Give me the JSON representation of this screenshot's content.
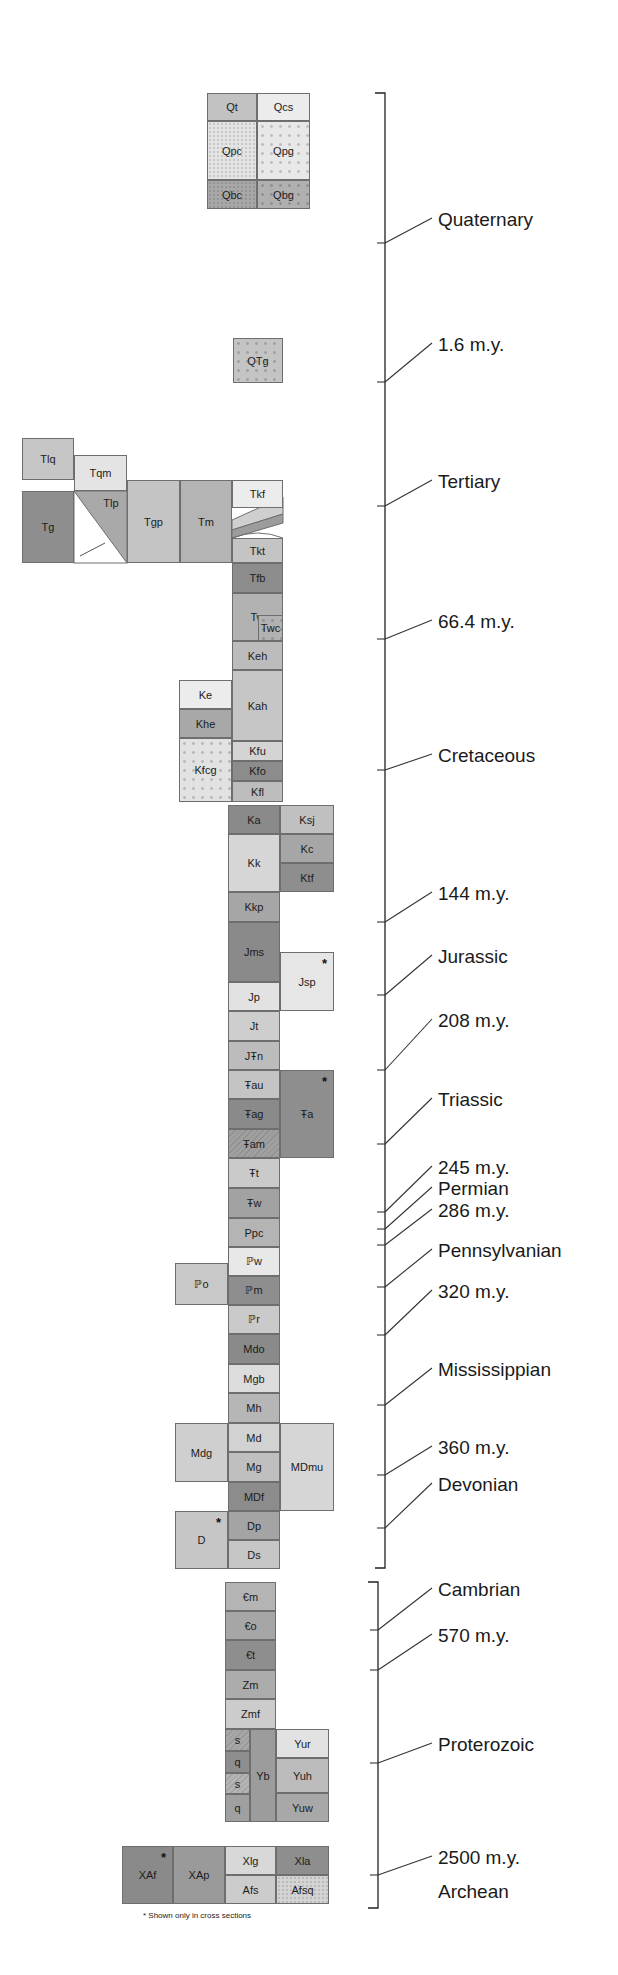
{
  "chart_data": {
    "type": "diagram",
    "units": [
      {
        "id": "Qt",
        "x": 207,
        "y": 93,
        "w": 50,
        "h": 28,
        "color": "#c2c2c2",
        "pattern": "none"
      },
      {
        "id": "Qcs",
        "x": 257,
        "y": 93,
        "w": 53,
        "h": 28,
        "color": "#ececec",
        "pattern": "none"
      },
      {
        "id": "Qpc",
        "x": 207,
        "y": 121,
        "w": 50,
        "h": 59,
        "color": "#e4e4e4",
        "pattern": "stipple"
      },
      {
        "id": "Qpg",
        "x": 257,
        "y": 121,
        "w": 53,
        "h": 59,
        "color": "#e8e8e8",
        "pattern": "dots"
      },
      {
        "id": "Qbc",
        "x": 207,
        "y": 180,
        "w": 50,
        "h": 29,
        "color": "#a8a8a8",
        "pattern": "stipple"
      },
      {
        "id": "Qbg",
        "x": 257,
        "y": 180,
        "w": 53,
        "h": 29,
        "color": "#b0b0b0",
        "pattern": "dots"
      },
      {
        "id": "QTg",
        "x": 233,
        "y": 338,
        "w": 50,
        "h": 45,
        "color": "#c4c4c4",
        "pattern": "dots"
      },
      {
        "id": "Tlq",
        "x": 22,
        "y": 438,
        "w": 52,
        "h": 42,
        "color": "#c6c6c6",
        "pattern": "none"
      },
      {
        "id": "Tqm",
        "x": 74,
        "y": 455,
        "w": 53,
        "h": 36,
        "color": "#e4e4e4",
        "pattern": "none"
      },
      {
        "id": "Tg",
        "x": 22,
        "y": 491,
        "w": 52,
        "h": 72,
        "color": "#8e8e8e",
        "pattern": "none"
      },
      {
        "id": "Tgp",
        "x": 127,
        "y": 480,
        "w": 53,
        "h": 83,
        "color": "#c4c4c4",
        "pattern": "none"
      },
      {
        "id": "Tm",
        "x": 180,
        "y": 480,
        "w": 52,
        "h": 83,
        "color": "#b4b4b4",
        "pattern": "none"
      },
      {
        "id": "Tkf",
        "x": 232,
        "y": 480,
        "w": 51,
        "h": 28,
        "color": "#ececec",
        "pattern": "none"
      },
      {
        "id": "Tkt",
        "x": 232,
        "y": 538,
        "w": 51,
        "h": 25,
        "color": "#c4c4c4",
        "pattern": "none"
      },
      {
        "id": "Tfb",
        "x": 232,
        "y": 563,
        "w": 51,
        "h": 30,
        "color": "#8c8c8c",
        "pattern": "none"
      },
      {
        "id": "Tw",
        "x": 232,
        "y": 593,
        "w": 51,
        "h": 48,
        "color": "#b2b2b2",
        "pattern": "none"
      },
      {
        "id": "Twc",
        "x": 258,
        "y": 615,
        "w": 25,
        "h": 26,
        "color": "#b2b2b2",
        "pattern": "dots"
      },
      {
        "id": "Keh",
        "x": 232,
        "y": 641,
        "w": 51,
        "h": 29,
        "color": "#bcbcbc",
        "pattern": "none"
      },
      {
        "id": "Kah",
        "x": 232,
        "y": 670,
        "w": 51,
        "h": 71,
        "color": "#c6c6c6",
        "pattern": "none"
      },
      {
        "id": "Ke",
        "x": 179,
        "y": 680,
        "w": 53,
        "h": 29,
        "color": "#ececec",
        "pattern": "none"
      },
      {
        "id": "Khe",
        "x": 179,
        "y": 709,
        "w": 53,
        "h": 29,
        "color": "#a8a8a8",
        "pattern": "none"
      },
      {
        "id": "Kfcg",
        "x": 179,
        "y": 738,
        "w": 53,
        "h": 64,
        "color": "#e2e2e2",
        "pattern": "dots"
      },
      {
        "id": "Kfu",
        "x": 232,
        "y": 741,
        "w": 51,
        "h": 20,
        "color": "#d4d4d4",
        "pattern": "none"
      },
      {
        "id": "Kfo",
        "x": 232,
        "y": 761,
        "w": 51,
        "h": 20,
        "color": "#8c8c8c",
        "pattern": "none"
      },
      {
        "id": "Kfl",
        "x": 232,
        "y": 781,
        "w": 51,
        "h": 21,
        "color": "#bdbdbd",
        "pattern": "none"
      },
      {
        "id": "Ka",
        "x": 228,
        "y": 805,
        "w": 52,
        "h": 29,
        "color": "#8a8a8a",
        "pattern": "none"
      },
      {
        "id": "Ksj",
        "x": 280,
        "y": 805,
        "w": 54,
        "h": 29,
        "color": "#c0c0c0",
        "pattern": "none"
      },
      {
        "id": "Kk",
        "x": 228,
        "y": 834,
        "w": 52,
        "h": 58,
        "color": "#d6d6d6",
        "pattern": "none"
      },
      {
        "id": "Kc",
        "x": 280,
        "y": 834,
        "w": 54,
        "h": 29,
        "color": "#a6a6a6",
        "pattern": "none"
      },
      {
        "id": "Ktf",
        "x": 280,
        "y": 863,
        "w": 54,
        "h": 29,
        "color": "#8e8e8e",
        "pattern": "none"
      },
      {
        "id": "Kkp",
        "x": 228,
        "y": 892,
        "w": 52,
        "h": 30,
        "color": "#a6a6a6",
        "pattern": "none"
      },
      {
        "id": "Jms",
        "x": 228,
        "y": 922,
        "w": 52,
        "h": 60,
        "color": "#8a8a8a",
        "pattern": "none"
      },
      {
        "id": "Jsp",
        "x": 280,
        "y": 952,
        "w": 54,
        "h": 59,
        "color": "#e6e6e6",
        "pattern": "none",
        "star": true
      },
      {
        "id": "Jp",
        "x": 228,
        "y": 982,
        "w": 52,
        "h": 29,
        "color": "#e2e2e2",
        "pattern": "none"
      },
      {
        "id": "Jt",
        "x": 228,
        "y": 1011,
        "w": 52,
        "h": 30,
        "color": "#cecece",
        "pattern": "none"
      },
      {
        "id": "JTRn",
        "label": "JŦn",
        "x": 228,
        "y": 1041,
        "w": 52,
        "h": 29,
        "color": "#bcbcbc",
        "pattern": "none"
      },
      {
        "id": "TRau",
        "label": "Ŧau",
        "x": 228,
        "y": 1070,
        "w": 52,
        "h": 29,
        "color": "#c4c4c4",
        "pattern": "none"
      },
      {
        "id": "TRa",
        "label": "Ŧa",
        "x": 280,
        "y": 1070,
        "w": 54,
        "h": 88,
        "color": "#8e8e8e",
        "pattern": "none",
        "star": true
      },
      {
        "id": "TRag",
        "label": "Ŧag",
        "x": 228,
        "y": 1099,
        "w": 52,
        "h": 30,
        "color": "#8a8a8a",
        "pattern": "none"
      },
      {
        "id": "TRam",
        "label": "Ŧam",
        "x": 228,
        "y": 1129,
        "w": 52,
        "h": 29,
        "color": "#a0a0a0",
        "pattern": "hatch"
      },
      {
        "id": "TRt",
        "label": "Ŧt",
        "x": 228,
        "y": 1158,
        "w": 52,
        "h": 30,
        "color": "#cacaca",
        "pattern": "none"
      },
      {
        "id": "TRw",
        "label": "Ŧw",
        "x": 228,
        "y": 1188,
        "w": 52,
        "h": 30,
        "color": "#a2a2a2",
        "pattern": "none"
      },
      {
        "id": "Ppc",
        "x": 228,
        "y": 1218,
        "w": 52,
        "h": 29,
        "color": "#b4b4b4",
        "pattern": "none"
      },
      {
        "id": "IPw",
        "label": "ℙw",
        "x": 228,
        "y": 1247,
        "w": 52,
        "h": 29,
        "color": "#e8e8e8",
        "pattern": "none"
      },
      {
        "id": "IPo",
        "label": "ℙo",
        "x": 175,
        "y": 1263,
        "w": 53,
        "h": 42,
        "color": "#c8c8c8",
        "pattern": "none"
      },
      {
        "id": "IPm",
        "label": "ℙm",
        "x": 228,
        "y": 1276,
        "w": 52,
        "h": 29,
        "color": "#8e8e8e",
        "pattern": "none"
      },
      {
        "id": "IPr",
        "label": "ℙr",
        "x": 228,
        "y": 1305,
        "w": 52,
        "h": 29,
        "color": "#cacaca",
        "pattern": "none"
      },
      {
        "id": "Mdo",
        "x": 228,
        "y": 1334,
        "w": 52,
        "h": 30,
        "color": "#8a8a8a",
        "pattern": "none"
      },
      {
        "id": "Mgb",
        "x": 228,
        "y": 1364,
        "w": 52,
        "h": 29,
        "color": "#dcdcdc",
        "pattern": "none"
      },
      {
        "id": "Mh",
        "x": 228,
        "y": 1393,
        "w": 52,
        "h": 30,
        "color": "#b6b6b6",
        "pattern": "none"
      },
      {
        "id": "Mdg",
        "x": 175,
        "y": 1423,
        "w": 53,
        "h": 59,
        "color": "#cfcfcf",
        "pattern": "none"
      },
      {
        "id": "Md",
        "x": 228,
        "y": 1423,
        "w": 52,
        "h": 29,
        "color": "#d2d2d2",
        "pattern": "none"
      },
      {
        "id": "MDmu",
        "x": 280,
        "y": 1423,
        "w": 54,
        "h": 88,
        "color": "#d6d6d6",
        "pattern": "none"
      },
      {
        "id": "Mg",
        "x": 228,
        "y": 1452,
        "w": 52,
        "h": 30,
        "color": "#bfbfbf",
        "pattern": "none"
      },
      {
        "id": "MDf",
        "x": 228,
        "y": 1482,
        "w": 52,
        "h": 29,
        "color": "#8c8c8c",
        "pattern": "none"
      },
      {
        "id": "D",
        "x": 175,
        "y": 1511,
        "w": 53,
        "h": 58,
        "color": "#c6c6c6",
        "pattern": "none",
        "star": true
      },
      {
        "id": "Dp",
        "x": 228,
        "y": 1511,
        "w": 52,
        "h": 29,
        "color": "#a4a4a4",
        "pattern": "none"
      },
      {
        "id": "Ds",
        "x": 228,
        "y": 1540,
        "w": 52,
        "h": 29,
        "color": "#c6c6c6",
        "pattern": "none"
      },
      {
        "id": "Cm",
        "label": "€m",
        "x": 225,
        "y": 1582,
        "w": 51,
        "h": 29,
        "color": "#b4b4b4",
        "pattern": "none"
      },
      {
        "id": "Co",
        "label": "€o",
        "x": 225,
        "y": 1611,
        "w": 51,
        "h": 29,
        "color": "#a6a6a6",
        "pattern": "none"
      },
      {
        "id": "Ct",
        "label": "€t",
        "x": 225,
        "y": 1640,
        "w": 51,
        "h": 30,
        "color": "#8e8e8e",
        "pattern": "none"
      },
      {
        "id": "Zm",
        "x": 225,
        "y": 1670,
        "w": 51,
        "h": 29,
        "color": "#acacac",
        "pattern": "none"
      },
      {
        "id": "Zmf",
        "x": 225,
        "y": 1699,
        "w": 51,
        "h": 30,
        "color": "#cccccc",
        "pattern": "none"
      },
      {
        "id": "s1",
        "label": "s",
        "x": 225,
        "y": 1729,
        "w": 25,
        "h": 22,
        "color": "#a8a8a8",
        "pattern": "hatch"
      },
      {
        "id": "q1",
        "label": "q",
        "x": 225,
        "y": 1751,
        "w": 25,
        "h": 22,
        "color": "#8e8e8e",
        "pattern": "none"
      },
      {
        "id": "s2",
        "label": "s",
        "x": 225,
        "y": 1773,
        "w": 25,
        "h": 21,
        "color": "#b4b4b4",
        "pattern": "hatch"
      },
      {
        "id": "q2",
        "label": "q",
        "x": 225,
        "y": 1794,
        "w": 25,
        "h": 28,
        "color": "#a0a0a0",
        "pattern": "none"
      },
      {
        "id": "Yb",
        "x": 250,
        "y": 1729,
        "w": 26,
        "h": 93,
        "color": "#9c9c9c",
        "pattern": "none"
      },
      {
        "id": "Yur",
        "x": 276,
        "y": 1729,
        "w": 53,
        "h": 29,
        "color": "#e2e2e2",
        "pattern": "none"
      },
      {
        "id": "Yuh",
        "x": 276,
        "y": 1758,
        "w": 53,
        "h": 35,
        "color": "#bcbcbc",
        "pattern": "none"
      },
      {
        "id": "Yuw",
        "x": 276,
        "y": 1793,
        "w": 53,
        "h": 29,
        "color": "#a8a8a8",
        "pattern": "none"
      },
      {
        "id": "XAf",
        "x": 122,
        "y": 1846,
        "w": 51,
        "h": 58,
        "color": "#8a8a8a",
        "pattern": "none",
        "star": true
      },
      {
        "id": "XAp",
        "x": 173,
        "y": 1846,
        "w": 52,
        "h": 58,
        "color": "#9a9a9a",
        "pattern": "none"
      },
      {
        "id": "Xlg",
        "x": 225,
        "y": 1846,
        "w": 51,
        "h": 29,
        "color": "#d8d8d8",
        "pattern": "none"
      },
      {
        "id": "Xla",
        "x": 276,
        "y": 1846,
        "w": 53,
        "h": 29,
        "color": "#8e8e8e",
        "pattern": "none"
      },
      {
        "id": "Afs",
        "x": 225,
        "y": 1875,
        "w": 51,
        "h": 29,
        "color": "#cccccc",
        "pattern": "none"
      },
      {
        "id": "Afsq",
        "x": 276,
        "y": 1875,
        "w": 53,
        "h": 29,
        "color": "#d4d4d4",
        "pattern": "stipple"
      }
    ],
    "time_labels": [
      {
        "text": "Quaternary",
        "y": 220,
        "tick": 243
      },
      {
        "text": "1.6 m.y.",
        "y": 345,
        "tick": 382
      },
      {
        "text": "Tertiary",
        "y": 482,
        "tick": 506
      },
      {
        "text": "66.4 m.y.",
        "y": 622,
        "tick": 639
      },
      {
        "text": "Cretaceous",
        "y": 756,
        "tick": 770
      },
      {
        "text": "144 m.y.",
        "y": 894,
        "tick": 922
      },
      {
        "text": "Jurassic",
        "y": 957,
        "tick": 995
      },
      {
        "text": "208 m.y.",
        "y": 1021,
        "tick": 1070
      },
      {
        "text": "Triassic",
        "y": 1100,
        "tick": 1144
      },
      {
        "text": "245 m.y.",
        "y": 1168,
        "tick": 1212
      },
      {
        "text": "Permian",
        "y": 1189,
        "tick": 1229
      },
      {
        "text": "286 m.y.",
        "y": 1211,
        "tick": 1245
      },
      {
        "text": "Pennsylvanian",
        "y": 1251,
        "tick": 1287
      },
      {
        "text": "320 m.y.",
        "y": 1292,
        "tick": 1335
      },
      {
        "text": "Mississippian",
        "y": 1370,
        "tick": 1405
      },
      {
        "text": "360 m.y.",
        "y": 1448,
        "tick": 1475
      },
      {
        "text": "Devonian",
        "y": 1485,
        "tick": 1528
      },
      {
        "text": "Cambrian",
        "y": 1590,
        "tick": 1630
      },
      {
        "text": "570 m.y.",
        "y": 1636,
        "tick": 1670
      },
      {
        "text": "Proterozoic",
        "y": 1745,
        "tick": 1763
      },
      {
        "text": "2500 m.y.",
        "y": 1858,
        "tick": 1875
      },
      {
        "text": "Archean",
        "y": 1892,
        "tick": null
      }
    ],
    "brackets": [
      {
        "x": 385,
        "top": 93,
        "bottom": 1568
      },
      {
        "x": 378,
        "top": 1582,
        "bottom": 1908
      }
    ],
    "footnote": "* Shown only in cross sections"
  }
}
